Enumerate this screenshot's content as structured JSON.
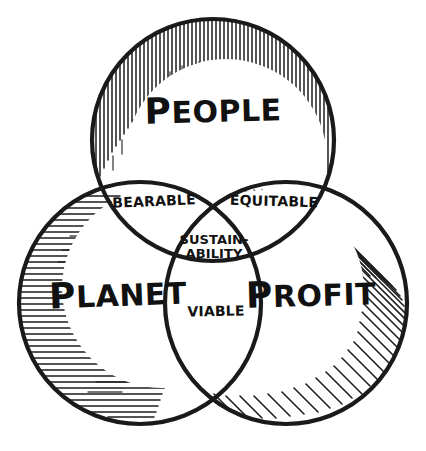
{
  "diagram": {
    "type": "venn-3-circle",
    "style": "hand-drawn ink sketch, black on white",
    "background_color": "#ffffff",
    "ink_color": "#1a1a1a",
    "circles": [
      {
        "id": "people",
        "label": "PEOPLE",
        "label_initial": "P",
        "label_rest": "EOPLE",
        "position": "top",
        "hatching": "vertical-strokes",
        "center_x": 213,
        "center_y": 140,
        "radius": 122
      },
      {
        "id": "planet",
        "label": "PLANET",
        "label_initial": "P",
        "label_rest": "LANET",
        "position": "bottom-left",
        "hatching": "horizontal-strokes",
        "center_x": 140,
        "center_y": 303,
        "radius": 122
      },
      {
        "id": "profit",
        "label": "PROFIT",
        "label_initial": "P",
        "label_rest": "ROFIT",
        "position": "bottom-right",
        "hatching": "diagonal-strokes",
        "center_x": 286,
        "center_y": 303,
        "radius": 122
      }
    ],
    "intersections": [
      {
        "id": "bearable",
        "label": "BEARABLE",
        "of": [
          "people",
          "planet"
        ]
      },
      {
        "id": "equitable",
        "label": "EQUITABLE",
        "of": [
          "people",
          "profit"
        ]
      },
      {
        "id": "viable",
        "label": "VIABLE",
        "of": [
          "planet",
          "profit"
        ]
      },
      {
        "id": "sustainability",
        "label": "SUSTAIN-ABILITY",
        "label_line_1": "SUSTAIN-",
        "label_line_2": "ABILITY",
        "of": [
          "people",
          "planet",
          "profit"
        ]
      }
    ]
  }
}
